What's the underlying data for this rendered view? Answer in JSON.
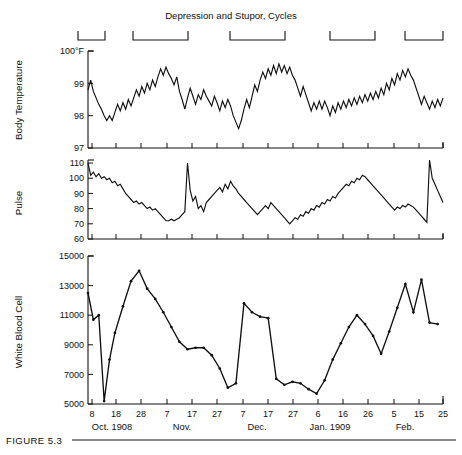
{
  "figure": {
    "title": "Depression and Stupor, Cycles",
    "caption": "FIGURE 5.3"
  },
  "axis_months": [
    {
      "label": "Oct. 1908",
      "x": 112
    },
    {
      "label": "Nov.",
      "x": 182
    },
    {
      "label": "Dec.",
      "x": 257
    },
    {
      "label": "Jan. 1909",
      "x": 330
    },
    {
      "label": "Feb.",
      "x": 405
    }
  ],
  "episode_brackets": [
    {
      "start_x": 78,
      "end_x": 105
    },
    {
      "start_x": 133,
      "end_x": 188
    },
    {
      "start_x": 230,
      "end_x": 285
    },
    {
      "start_x": 330,
      "end_x": 375
    },
    {
      "start_x": 405,
      "end_x": 443
    }
  ],
  "chart_data": [
    {
      "type": "line",
      "title": "Body Temperature",
      "ylabel": "Body Temperature",
      "xlabel": "",
      "ylim": [
        97,
        100
      ],
      "yticks": [
        100,
        99,
        98,
        97
      ],
      "ytick_labels": [
        "100°F",
        "99",
        "98",
        "97"
      ],
      "grid": false,
      "legend": "none",
      "x": [
        8,
        9,
        10,
        11,
        12,
        13,
        14,
        15,
        16,
        17,
        18,
        19,
        20,
        21,
        22,
        23,
        24,
        25,
        26,
        27,
        28,
        29,
        30,
        31,
        32,
        33,
        34,
        35,
        36,
        37,
        38,
        39,
        40,
        41,
        42,
        43,
        44,
        45,
        46,
        47,
        48,
        49,
        50,
        51,
        52,
        53,
        54,
        55,
        56,
        57,
        58,
        59,
        60,
        61,
        62,
        63,
        64,
        65,
        66,
        67,
        68,
        69,
        70,
        71,
        72,
        73,
        74,
        75,
        76,
        77,
        78,
        79,
        80,
        81,
        82,
        83,
        84,
        85,
        86,
        87,
        88,
        89,
        90,
        91,
        92,
        93,
        94,
        95,
        96,
        97,
        98,
        99,
        100,
        101,
        102,
        103,
        104,
        105,
        106,
        107,
        108,
        109,
        110,
        111,
        112,
        113,
        114,
        115,
        116,
        117,
        118,
        119,
        120,
        121,
        122,
        123,
        124,
        125,
        126,
        127,
        128,
        129,
        130,
        131,
        132,
        133,
        134,
        135,
        136,
        137,
        138,
        139,
        140
      ],
      "values": [
        98.8,
        99.1,
        98.75,
        98.55,
        98.35,
        98.2,
        98.0,
        97.85,
        98.0,
        97.85,
        98.1,
        98.35,
        98.15,
        98.4,
        98.2,
        98.5,
        98.3,
        98.55,
        98.8,
        98.6,
        98.9,
        98.7,
        99.0,
        98.8,
        99.1,
        98.9,
        99.2,
        99.45,
        99.25,
        99.5,
        99.3,
        99.15,
        98.95,
        99.2,
        98.75,
        98.5,
        98.2,
        98.55,
        98.85,
        98.6,
        98.35,
        98.65,
        98.5,
        98.8,
        98.6,
        98.45,
        98.3,
        98.6,
        98.4,
        98.15,
        98.45,
        98.25,
        98.5,
        98.3,
        98.0,
        97.8,
        97.6,
        97.85,
        98.2,
        98.5,
        98.25,
        98.6,
        98.95,
        98.75,
        99.1,
        99.35,
        99.15,
        99.45,
        99.25,
        99.55,
        99.3,
        99.6,
        99.35,
        99.55,
        99.3,
        99.5,
        99.25,
        99.1,
        98.85,
        98.6,
        98.9,
        98.65,
        98.4,
        98.15,
        98.4,
        98.2,
        98.45,
        98.2,
        98.45,
        98.25,
        98.0,
        98.3,
        98.1,
        98.4,
        98.2,
        98.45,
        98.25,
        98.5,
        98.3,
        98.55,
        98.35,
        98.6,
        98.4,
        98.65,
        98.45,
        98.7,
        98.5,
        98.75,
        98.55,
        98.85,
        98.65,
        99.0,
        98.8,
        99.15,
        98.95,
        99.3,
        99.1,
        99.4,
        99.2,
        99.45,
        99.25,
        99.1,
        98.85,
        98.6,
        98.35,
        98.6,
        98.4,
        98.2,
        98.45,
        98.25,
        98.5,
        98.3,
        98.55,
        98.35,
        98.15,
        98.4,
        98.1,
        97.85
      ],
      "peak_annotation": {
        "x": 133,
        "value": 100.0,
        "note": "terminal spike to 100°F"
      }
    },
    {
      "type": "line",
      "title": "Pulse",
      "ylabel": "Pulse",
      "xlabel": "",
      "ylim": [
        60,
        112
      ],
      "yticks": [
        110,
        100,
        90,
        80,
        70,
        60
      ],
      "ytick_labels": [
        "110",
        "100",
        "90",
        "80",
        "70",
        "60"
      ],
      "grid": false,
      "legend": "none",
      "x": [
        8,
        9,
        10,
        11,
        12,
        13,
        14,
        15,
        16,
        17,
        18,
        19,
        20,
        21,
        22,
        23,
        24,
        25,
        26,
        27,
        28,
        29,
        30,
        31,
        32,
        33,
        34,
        35,
        36,
        37,
        38,
        39,
        40,
        41,
        42,
        43,
        44,
        45,
        46,
        47,
        48,
        49,
        50,
        51,
        52,
        53,
        54,
        55,
        56,
        57,
        58,
        59,
        60,
        61,
        62,
        63,
        64,
        65,
        66,
        67,
        68,
        69,
        70,
        71,
        72,
        73,
        74,
        75,
        76,
        77,
        78,
        79,
        80,
        81,
        82,
        83,
        84,
        85,
        86,
        87,
        88,
        89,
        90,
        91,
        92,
        93,
        94,
        95,
        96,
        97,
        98,
        99,
        100,
        101,
        102,
        103,
        104,
        105,
        106,
        107,
        108,
        109,
        110,
        111,
        112,
        113,
        114,
        115,
        116,
        117,
        118,
        119,
        120,
        121,
        122,
        123,
        124,
        125,
        126,
        127,
        128,
        129,
        130,
        131,
        132,
        133,
        134,
        135,
        136,
        137,
        138,
        139,
        140
      ],
      "values": [
        110,
        102,
        104,
        101,
        103,
        100,
        101,
        99,
        100,
        97,
        98,
        95,
        96,
        93,
        90,
        88,
        86,
        84,
        85,
        83,
        84,
        82,
        80,
        81,
        79,
        80,
        78,
        76,
        74,
        72,
        72,
        73,
        72,
        73,
        74,
        76,
        78,
        110,
        92,
        85,
        88,
        80,
        82,
        78,
        84,
        86,
        88,
        90,
        92,
        94,
        91,
        96,
        93,
        98,
        95,
        93,
        90,
        88,
        86,
        84,
        82,
        80,
        78,
        76,
        78,
        80,
        82,
        80,
        84,
        82,
        80,
        78,
        76,
        74,
        72,
        70,
        72,
        74,
        73,
        76,
        75,
        78,
        77,
        80,
        79,
        82,
        81,
        84,
        83,
        86,
        85,
        88,
        87,
        90,
        92,
        94,
        96,
        95,
        98,
        97,
        100,
        99,
        102,
        101,
        99,
        97,
        95,
        93,
        91,
        89,
        87,
        85,
        83,
        81,
        79,
        81,
        80,
        82,
        81,
        83,
        82,
        81,
        79,
        77,
        75,
        73,
        71,
        112,
        100,
        96,
        92,
        88,
        84,
        86,
        90,
        94,
        92,
        88,
        86
      ],
      "peak_annotation": {
        "x": 135,
        "value": 112,
        "note": "terminal spike"
      }
    },
    {
      "type": "line",
      "title": "White Blood Cell",
      "ylabel": "White Blood Cell",
      "xlabel": "",
      "ylim": [
        5000,
        15000
      ],
      "yticks": [
        15000,
        13000,
        11000,
        9000,
        7000,
        5000
      ],
      "ytick_labels": [
        "15000",
        "13000",
        "11000",
        "9000",
        "7000",
        "5000"
      ],
      "grid": false,
      "legend": "none",
      "x": [
        8,
        10,
        12,
        14,
        16,
        18,
        21,
        24,
        27,
        30,
        33,
        36,
        39,
        42,
        45,
        48,
        51,
        54,
        57,
        60,
        63,
        66,
        69,
        72,
        75,
        78,
        81,
        84,
        87,
        90,
        93,
        96,
        99,
        102,
        105,
        108,
        111,
        114,
        117,
        120,
        123,
        126,
        129,
        132,
        135,
        138
      ],
      "values": [
        12500,
        10700,
        11000,
        5200,
        8000,
        9800,
        11600,
        13300,
        14000,
        12800,
        12100,
        11200,
        10200,
        9200,
        8700,
        8800,
        8800,
        8300,
        7400,
        6100,
        6400,
        11800,
        11200,
        10900,
        10800,
        6700,
        6300,
        6500,
        6400,
        6000,
        5700,
        6600,
        8000,
        9100,
        10200,
        11000,
        10400,
        9600,
        8400,
        9900,
        11500,
        13100,
        11200,
        13400,
        10500,
        10400
      ]
    }
  ],
  "xaxis": {
    "ticks": [
      {
        "label": "8",
        "x": 92
      },
      {
        "label": "18",
        "x": 116
      },
      {
        "label": "28",
        "x": 141
      },
      {
        "label": "7",
        "x": 167
      },
      {
        "label": "17",
        "x": 192
      },
      {
        "label": "27",
        "x": 217
      },
      {
        "label": "7",
        "x": 243
      },
      {
        "label": "17",
        "x": 268
      },
      {
        "label": "27",
        "x": 293
      },
      {
        "label": "6",
        "x": 318
      },
      {
        "label": "16",
        "x": 343
      },
      {
        "label": "26",
        "x": 368
      },
      {
        "label": "5",
        "x": 394
      },
      {
        "label": "15",
        "x": 419
      },
      {
        "label": "25",
        "x": 443
      }
    ]
  }
}
